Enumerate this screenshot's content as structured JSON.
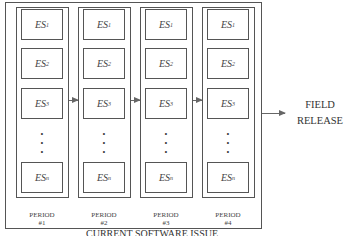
{
  "diagram": {
    "caption": "CURRENT SOFTWARE ISSUE",
    "output_label_line1": "FIELD",
    "output_label_line2": "RELEASE",
    "columns": [
      {
        "period": "PERIOD",
        "number": "#1",
        "items": [
          "ES",
          "ES",
          "ES",
          "ES"
        ],
        "subs": [
          "1",
          "2",
          "3",
          "n"
        ]
      },
      {
        "period": "PERIOD",
        "number": "#2",
        "items": [
          "ES",
          "ES",
          "ES",
          "ES"
        ],
        "subs": [
          "1",
          "2",
          "3",
          "n"
        ]
      },
      {
        "period": "PERIOD",
        "number": "#3",
        "items": [
          "ES",
          "ES",
          "ES",
          "ES"
        ],
        "subs": [
          "1",
          "2",
          "3",
          "n"
        ]
      },
      {
        "period": "PERIOD",
        "number": "#4",
        "items": [
          "ES",
          "ES",
          "ES",
          "ES"
        ],
        "subs": [
          "1",
          "2",
          "3",
          "n"
        ]
      }
    ],
    "ellipsis": "•"
  }
}
